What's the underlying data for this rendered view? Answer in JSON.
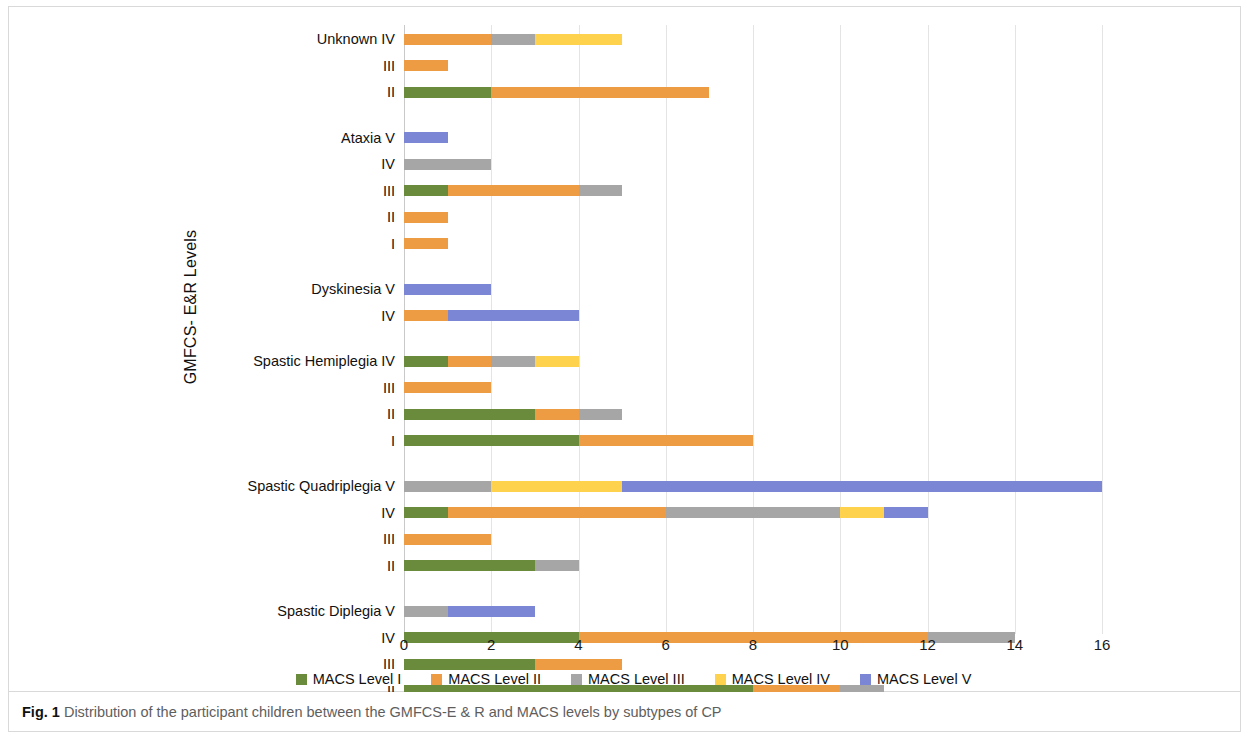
{
  "figure": {
    "caption_prefix": "Fig. 1",
    "caption_text": "Distribution of the participant children between the GMFCS-E & R and MACS levels by subtypes of CP"
  },
  "chart_data": {
    "type": "bar",
    "orientation": "horizontal",
    "stacked": true,
    "title": "",
    "xlabel": "",
    "ylabel": "GMFCS- E&R Levels",
    "xlim": [
      0,
      16
    ],
    "xticks": [
      0,
      2,
      4,
      6,
      8,
      10,
      12,
      14,
      16
    ],
    "grid": "vertical",
    "legend_position": "bottom",
    "colors": {
      "MACS Level I": "#6A8B3C",
      "MACS Level II": "#ED9C43",
      "MACS Level III": "#A6A6A6",
      "MACS Level IV": "#FFD24D",
      "MACS Level V": "#7B86D4"
    },
    "series": [
      {
        "name": "MACS Level I",
        "color": "#6A8B3C"
      },
      {
        "name": "MACS Level II",
        "color": "#ED9C43"
      },
      {
        "name": "MACS Level III",
        "color": "#A6A6A6"
      },
      {
        "name": "MACS Level IV",
        "color": "#FFD24D"
      },
      {
        "name": "MACS Level V",
        "color": "#7B86D4"
      }
    ],
    "groups": [
      {
        "group": "Unknown",
        "rows": [
          {
            "label": "Unknown IV",
            "level": "IV",
            "values": [
              0,
              2,
              1,
              2,
              0
            ],
            "total": 5
          },
          {
            "label": "III",
            "level": "III",
            "values": [
              0,
              1,
              0,
              0,
              0
            ],
            "total": 1
          },
          {
            "label": "II",
            "level": "II",
            "values": [
              2,
              5,
              0,
              0,
              0
            ],
            "total": 7
          }
        ]
      },
      {
        "group": "Ataxia",
        "rows": [
          {
            "label": "Ataxia  V",
            "level": "V",
            "values": [
              0,
              0,
              0,
              0,
              1
            ],
            "total": 1
          },
          {
            "label": "IV",
            "level": "IV",
            "values": [
              0,
              0,
              2,
              0,
              0
            ],
            "total": 2
          },
          {
            "label": "III",
            "level": "III",
            "values": [
              1,
              3,
              1,
              0,
              0
            ],
            "total": 5
          },
          {
            "label": "II",
            "level": "II",
            "values": [
              0,
              1,
              0,
              0,
              0
            ],
            "total": 1
          },
          {
            "label": "I",
            "level": "I",
            "values": [
              0,
              1,
              0,
              0,
              0
            ],
            "total": 1
          }
        ]
      },
      {
        "group": "Dyskinesia",
        "rows": [
          {
            "label": "Dyskinesia  V",
            "level": "V",
            "values": [
              0,
              0,
              0,
              0,
              2
            ],
            "total": 2
          },
          {
            "label": "IV",
            "level": "IV",
            "values": [
              0,
              1,
              0,
              0,
              3
            ],
            "total": 4
          }
        ]
      },
      {
        "group": "Spastic Hemiplegia",
        "rows": [
          {
            "label": "Spastic Hemiplegia IV",
            "level": "IV",
            "values": [
              1,
              1,
              1,
              1,
              0
            ],
            "total": 4
          },
          {
            "label": "III",
            "level": "III",
            "values": [
              0,
              2,
              0,
              0,
              0
            ],
            "total": 2
          },
          {
            "label": "II",
            "level": "II",
            "values": [
              3,
              1,
              1,
              0,
              0
            ],
            "total": 5
          },
          {
            "label": "I",
            "level": "I",
            "values": [
              4,
              4,
              0,
              0,
              0
            ],
            "total": 8
          }
        ]
      },
      {
        "group": "Spastic Quadriplegia",
        "rows": [
          {
            "label": "Spastic Quadriplegia V",
            "level": "V",
            "values": [
              0,
              0,
              2,
              3,
              11
            ],
            "total": 16
          },
          {
            "label": "IV",
            "level": "IV",
            "values": [
              1,
              5,
              4,
              1,
              1
            ],
            "total": 12
          },
          {
            "label": "III",
            "level": "III",
            "values": [
              0,
              2,
              0,
              0,
              0
            ],
            "total": 2
          },
          {
            "label": "II",
            "level": "II",
            "values": [
              3,
              0,
              1,
              0,
              0
            ],
            "total": 4
          }
        ]
      },
      {
        "group": "Spastic Diplegia",
        "rows": [
          {
            "label": "Spastic Diplegia V",
            "level": "V",
            "values": [
              0,
              0,
              1,
              0,
              2
            ],
            "total": 3
          },
          {
            "label": "IV",
            "level": "IV",
            "values": [
              4,
              8,
              2,
              0,
              0
            ],
            "total": 14
          },
          {
            "label": "III",
            "level": "III",
            "values": [
              3,
              2,
              0,
              0,
              0
            ],
            "total": 5
          },
          {
            "label": "II",
            "level": "II",
            "values": [
              8,
              2,
              1,
              0,
              0
            ],
            "total": 11
          },
          {
            "label": "I",
            "level": "I",
            "values": [
              7,
              0,
              0,
              0,
              0
            ],
            "total": 7
          }
        ]
      }
    ]
  }
}
